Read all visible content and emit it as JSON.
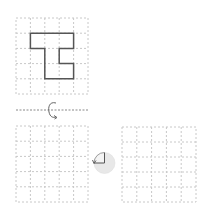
{
  "diagram": {
    "grid_size": 5,
    "colors": {
      "grid_line": "#c8c8c8",
      "shape_stroke": "#555555",
      "axis_line": "#888888",
      "arrow": "#666666",
      "rotation_disc_fill": "#e8e8e8",
      "rotation_quadrant": "#555555"
    },
    "source_grid": {
      "shape_polygon_cells": [
        [
          1,
          1
        ],
        [
          4,
          1
        ],
        [
          4,
          2
        ],
        [
          3,
          2
        ],
        [
          3,
          3
        ],
        [
          4,
          3
        ],
        [
          4,
          4
        ],
        [
          2,
          4
        ],
        [
          2,
          2
        ],
        [
          1,
          2
        ]
      ]
    },
    "flip_axis": {
      "type": "horizontal",
      "icon": "rotate-flip-arrow-icon"
    },
    "result_grid_left": {
      "shape_polygon_cells": []
    },
    "rotation_icon": {
      "name": "quarter-turn-icon",
      "fraction": "1/4"
    },
    "result_grid_right": {
      "shape_polygon_cells": []
    }
  }
}
